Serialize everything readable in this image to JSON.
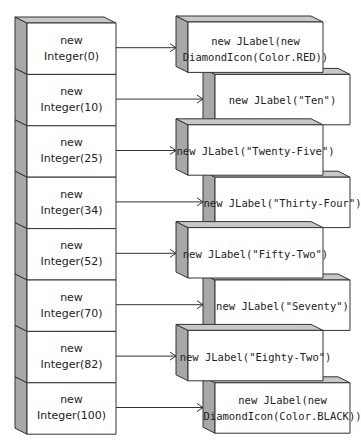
{
  "colors": {
    "front": "#ffffff",
    "side": "#a8a8a8",
    "top": "#c8c8c8",
    "stroke": "#333333",
    "text": "#222222"
  },
  "rows": [
    {
      "key": "new\nInteger(0)",
      "value": "new JLabel(new\nDiamondIcon(Color.RED))",
      "offset": 0
    },
    {
      "key": "new\nInteger(10)",
      "value": "new JLabel(\"Ten\")",
      "offset": 1
    },
    {
      "key": "new\nInteger(25)",
      "value": "new JLabel(\"Twenty-Five\")",
      "offset": 0
    },
    {
      "key": "new\nInteger(34)",
      "value": "new JLabel(\"Thirty-Four\")",
      "offset": 1
    },
    {
      "key": "new\nInteger(52)",
      "value": "new JLabel(\"Fifty-Two\")",
      "offset": 0
    },
    {
      "key": "new\nInteger(70)",
      "value": "new JLabel(\"Seventy\")",
      "offset": 1
    },
    {
      "key": "new\nInteger(82)",
      "value": "new JLabel(\"Eighty-Two\")",
      "offset": 0
    },
    {
      "key": "new\nInteger(100)",
      "value": "new JLabel(new\nDiamondIcon(Color.BLACK))",
      "offset": 1
    }
  ]
}
